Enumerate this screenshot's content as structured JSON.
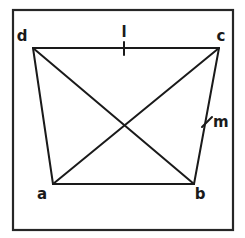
{
  "figure": {
    "canvas": {
      "width": 245,
      "height": 238,
      "background": "#ffffff"
    },
    "frame": {
      "name": "figure-border",
      "x": 13,
      "y": 10,
      "width": 220,
      "height": 220,
      "stroke": "#262626",
      "stroke_width": 2.2
    },
    "stroke_color": "#1a1a1a",
    "stroke_width": 2.0,
    "vertices": [
      {
        "id": "a",
        "label": "a",
        "x": 53,
        "y": 184,
        "label_x": 42,
        "label_y": 199
      },
      {
        "id": "b",
        "label": "b",
        "x": 194,
        "y": 184,
        "label_x": 200,
        "label_y": 199
      },
      {
        "id": "c",
        "label": "c",
        "x": 219,
        "y": 48,
        "label_x": 221,
        "label_y": 41
      },
      {
        "id": "d",
        "label": "d",
        "x": 33,
        "y": 48,
        "label_x": 22,
        "label_y": 41
      }
    ],
    "edges": [
      {
        "id": "dc",
        "name": "edge-d-c",
        "from": "d",
        "to": "c"
      },
      {
        "id": "cb",
        "name": "edge-c-b",
        "from": "c",
        "to": "b"
      },
      {
        "id": "ba",
        "name": "edge-b-a",
        "from": "b",
        "to": "a"
      },
      {
        "id": "ad",
        "name": "edge-a-d",
        "from": "a",
        "to": "d"
      }
    ],
    "diagonals": [
      {
        "id": "db",
        "name": "diagonal-d-b",
        "from": "d",
        "to": "b"
      },
      {
        "id": "ac",
        "name": "diagonal-a-c",
        "from": "a",
        "to": "c"
      }
    ],
    "intersection": {
      "name": "diagonal-intersection",
      "x": 125,
      "y": 130
    },
    "tick_marks": [
      {
        "id": "tick-l",
        "name": "tick-mark-on-edge-dc",
        "x1": 124,
        "y1": 42,
        "x2": 124,
        "y2": 55,
        "label": "l",
        "label_x": 121,
        "label_y": 37
      },
      {
        "id": "tick-m",
        "name": "tick-mark-on-edge-cb",
        "x1": 202,
        "y1": 127,
        "x2": 212,
        "y2": 117,
        "label": "m",
        "label_x": 213,
        "label_y": 127
      }
    ]
  }
}
